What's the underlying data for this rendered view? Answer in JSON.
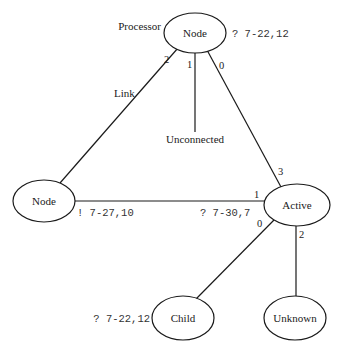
{
  "diagram": {
    "nodes": [
      {
        "id": "top",
        "label": "Node",
        "caption": "Processor",
        "annotation": "? 7-22,12"
      },
      {
        "id": "left",
        "label": "Node",
        "annotation": "! 7-27,10"
      },
      {
        "id": "active",
        "label": "Active"
      },
      {
        "id": "child",
        "label": "Child",
        "annotation": "? 7-22,12"
      },
      {
        "id": "unknown",
        "label": "Unknown"
      }
    ],
    "edges": [
      {
        "from": "top",
        "to": "left",
        "label": "Link",
        "from_port": "2"
      },
      {
        "from": "top",
        "to": "unconnected",
        "label": "Unconnected",
        "from_port": "1"
      },
      {
        "from": "top",
        "to": "active",
        "from_port": "0",
        "to_port": "3"
      },
      {
        "from": "left",
        "to": "active",
        "to_port": "1",
        "annotation": "? 7-30,7"
      },
      {
        "from": "active",
        "to": "child",
        "from_port": "0"
      },
      {
        "from": "active",
        "to": "unknown",
        "from_port": "2"
      }
    ]
  }
}
